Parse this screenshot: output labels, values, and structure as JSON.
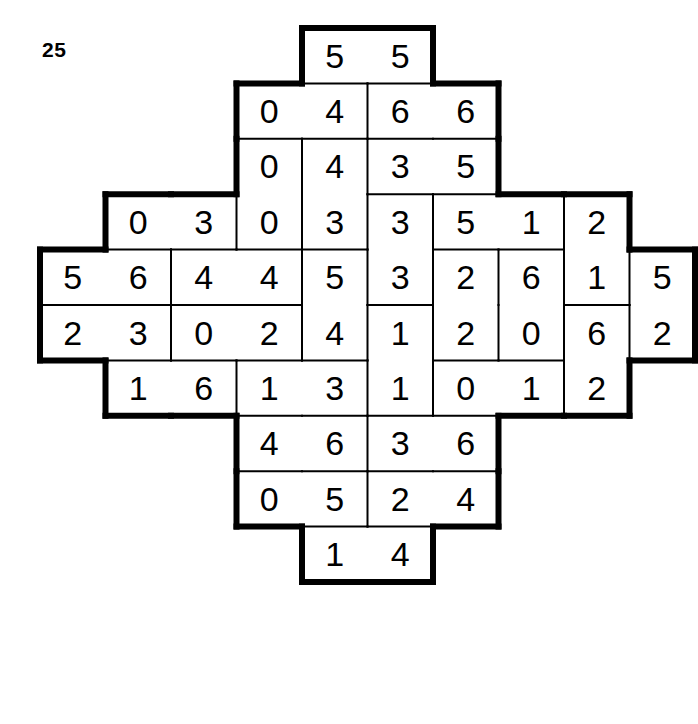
{
  "puzzle": {
    "label": "25",
    "type": "domino-dissection-puzzle",
    "colors": {
      "ink": "#000000",
      "paper": "#ffffff"
    },
    "geometry": {
      "origin_x": 40,
      "origin_y": 28,
      "cell_w": 65.5,
      "cell_h": 55.4,
      "cols": 10,
      "rows": 12,
      "outline_width": 6,
      "separator_width": 2
    },
    "rows": [
      {
        "index": 0,
        "start_col": 4,
        "values": [
          5,
          5
        ]
      },
      {
        "index": 1,
        "start_col": 3,
        "values": [
          0,
          4,
          6,
          6
        ]
      },
      {
        "index": 2,
        "start_col": 3,
        "values": [
          0,
          4,
          3,
          5
        ]
      },
      {
        "index": 3,
        "start_col": 1,
        "values": [
          0,
          3,
          0,
          3,
          3,
          5,
          1,
          2
        ]
      },
      {
        "index": 4,
        "start_col": 0,
        "values": [
          5,
          6,
          4,
          4,
          5,
          3,
          2,
          6,
          1,
          5
        ]
      },
      {
        "index": 5,
        "start_col": 0,
        "values": [
          2,
          3,
          0,
          2,
          4,
          1,
          2,
          0,
          6,
          2
        ]
      },
      {
        "index": 6,
        "start_col": 1,
        "values": [
          1,
          6,
          1,
          3,
          1,
          0,
          1,
          2
        ]
      },
      {
        "index": 7,
        "start_col": 3,
        "values": [
          4,
          6,
          3,
          6
        ]
      },
      {
        "index": 8,
        "start_col": 3,
        "values": [
          0,
          5,
          2,
          4
        ]
      },
      {
        "index": 9,
        "start_col": 4,
        "values": [
          1,
          4
        ]
      }
    ],
    "dominoes": [
      {
        "id": "d01",
        "a": [
          0,
          4
        ],
        "b": [
          0,
          5
        ],
        "values": [
          5,
          5
        ],
        "orientation": "h"
      },
      {
        "id": "d02",
        "a": [
          1,
          3
        ],
        "b": [
          1,
          4
        ],
        "values": [
          0,
          4
        ],
        "orientation": "h"
      },
      {
        "id": "d03",
        "a": [
          1,
          5
        ],
        "b": [
          1,
          6
        ],
        "values": [
          6,
          6
        ],
        "orientation": "h"
      },
      {
        "id": "d04",
        "a": [
          2,
          3
        ],
        "b": [
          3,
          3
        ],
        "values": [
          0,
          0
        ],
        "orientation": "v"
      },
      {
        "id": "d05",
        "a": [
          2,
          4
        ],
        "b": [
          3,
          4
        ],
        "values": [
          4,
          3
        ],
        "orientation": "v"
      },
      {
        "id": "d06",
        "a": [
          2,
          5
        ],
        "b": [
          2,
          6
        ],
        "values": [
          3,
          5
        ],
        "orientation": "h"
      },
      {
        "id": "d07",
        "a": [
          3,
          1
        ],
        "b": [
          3,
          2
        ],
        "values": [
          0,
          3
        ],
        "orientation": "h"
      },
      {
        "id": "d08",
        "a": [
          3,
          5
        ],
        "b": [
          4,
          5
        ],
        "values": [
          3,
          3
        ],
        "orientation": "v"
      },
      {
        "id": "d09",
        "a": [
          3,
          6
        ],
        "b": [
          3,
          7
        ],
        "values": [
          5,
          1
        ],
        "orientation": "h"
      },
      {
        "id": "d10",
        "a": [
          3,
          8
        ],
        "b": [
          4,
          8
        ],
        "values": [
          2,
          1
        ],
        "orientation": "v"
      },
      {
        "id": "d11",
        "a": [
          4,
          0
        ],
        "b": [
          4,
          1
        ],
        "values": [
          5,
          6
        ],
        "orientation": "h"
      },
      {
        "id": "d12",
        "a": [
          4,
          2
        ],
        "b": [
          4,
          3
        ],
        "values": [
          4,
          4
        ],
        "orientation": "h"
      },
      {
        "id": "d13",
        "a": [
          4,
          4
        ],
        "b": [
          5,
          4
        ],
        "values": [
          5,
          4
        ],
        "orientation": "v"
      },
      {
        "id": "d14",
        "a": [
          4,
          6
        ],
        "b": [
          5,
          6
        ],
        "values": [
          2,
          2
        ],
        "orientation": "v"
      },
      {
        "id": "d15",
        "a": [
          4,
          7
        ],
        "b": [
          5,
          7
        ],
        "values": [
          6,
          0
        ],
        "orientation": "v"
      },
      {
        "id": "d16",
        "a": [
          4,
          9
        ],
        "b": [
          5,
          9
        ],
        "values": [
          5,
          2
        ],
        "orientation": "v"
      },
      {
        "id": "d17",
        "a": [
          5,
          0
        ],
        "b": [
          5,
          1
        ],
        "values": [
          2,
          3
        ],
        "orientation": "h"
      },
      {
        "id": "d18",
        "a": [
          5,
          2
        ],
        "b": [
          5,
          3
        ],
        "values": [
          0,
          2
        ],
        "orientation": "h"
      },
      {
        "id": "d19",
        "a": [
          5,
          5
        ],
        "b": [
          6,
          5
        ],
        "values": [
          1,
          1
        ],
        "orientation": "v"
      },
      {
        "id": "d20",
        "a": [
          5,
          8
        ],
        "b": [
          6,
          8
        ],
        "values": [
          6,
          2
        ],
        "orientation": "v"
      },
      {
        "id": "d21",
        "a": [
          6,
          1
        ],
        "b": [
          6,
          2
        ],
        "values": [
          1,
          6
        ],
        "orientation": "h"
      },
      {
        "id": "d22",
        "a": [
          6,
          3
        ],
        "b": [
          6,
          4
        ],
        "values": [
          1,
          3
        ],
        "orientation": "h"
      },
      {
        "id": "d23",
        "a": [
          6,
          6
        ],
        "b": [
          6,
          7
        ],
        "values": [
          0,
          1
        ],
        "orientation": "h"
      },
      {
        "id": "d24",
        "a": [
          7,
          3
        ],
        "b": [
          7,
          4
        ],
        "values": [
          4,
          6
        ],
        "orientation": "h"
      },
      {
        "id": "d25",
        "a": [
          7,
          5
        ],
        "b": [
          7,
          6
        ],
        "values": [
          3,
          6
        ],
        "orientation": "h"
      },
      {
        "id": "d26",
        "a": [
          8,
          3
        ],
        "b": [
          8,
          4
        ],
        "values": [
          0,
          5
        ],
        "orientation": "h"
      },
      {
        "id": "d27",
        "a": [
          8,
          5
        ],
        "b": [
          8,
          6
        ],
        "values": [
          2,
          4
        ],
        "orientation": "h"
      },
      {
        "id": "d28",
        "a": [
          9,
          4
        ],
        "b": [
          9,
          5
        ],
        "values": [
          1,
          4
        ],
        "orientation": "h"
      }
    ]
  }
}
